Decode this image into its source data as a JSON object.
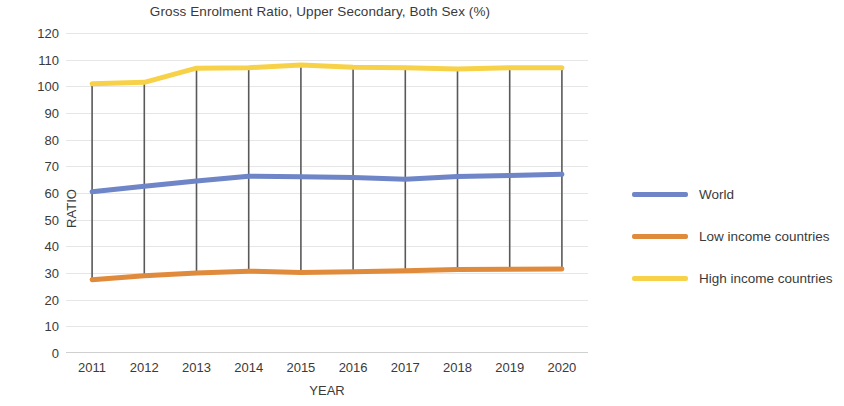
{
  "chart_data": {
    "type": "line",
    "title": "Gross Enrolment Ratio, Upper Secondary, Both Sex (%)",
    "xlabel": "YEAR",
    "ylabel": "RATIO",
    "categories": [
      "2011",
      "2012",
      "2013",
      "2014",
      "2015",
      "2016",
      "2017",
      "2018",
      "2019",
      "2020"
    ],
    "ylim": [
      0,
      120
    ],
    "ytick_step": 10,
    "yticks": [
      "120",
      "110",
      "100",
      "90",
      "80",
      "70",
      "60",
      "50",
      "40",
      "30",
      "20",
      "10",
      "0"
    ],
    "grid": true,
    "legend_position": "right",
    "high_low_lines": true,
    "series": [
      {
        "name": "World",
        "color": "#6e86c8",
        "values": [
          60.5,
          62.5,
          64.5,
          66.3,
          66.1,
          65.8,
          65.2,
          66.2,
          66.6,
          67.0
        ]
      },
      {
        "name": "Low income countries",
        "color": "#e08b3c",
        "values": [
          27.5,
          29.0,
          30.0,
          30.7,
          30.2,
          30.5,
          30.8,
          31.3,
          31.4,
          31.5
        ]
      },
      {
        "name": "High income countries",
        "color": "#f7d248",
        "values": [
          101.0,
          101.5,
          106.8,
          107.0,
          108.0,
          107.2,
          107.0,
          106.5,
          107.0,
          107.0
        ]
      }
    ]
  }
}
